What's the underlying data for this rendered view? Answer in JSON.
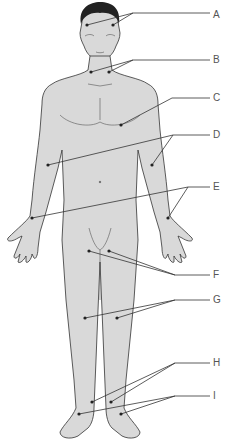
{
  "figure": {
    "body_fill": "#d9d9d9",
    "outline_color": "#333333",
    "leader_color": "#333333"
  },
  "labels": [
    {
      "letter": "A",
      "y": 15
    },
    {
      "letter": "B",
      "y": 60
    },
    {
      "letter": "C",
      "y": 98
    },
    {
      "letter": "D",
      "y": 135
    },
    {
      "letter": "E",
      "y": 187
    },
    {
      "letter": "F",
      "y": 275
    },
    {
      "letter": "G",
      "y": 300
    },
    {
      "letter": "H",
      "y": 363
    },
    {
      "letter": "I",
      "y": 396
    }
  ]
}
